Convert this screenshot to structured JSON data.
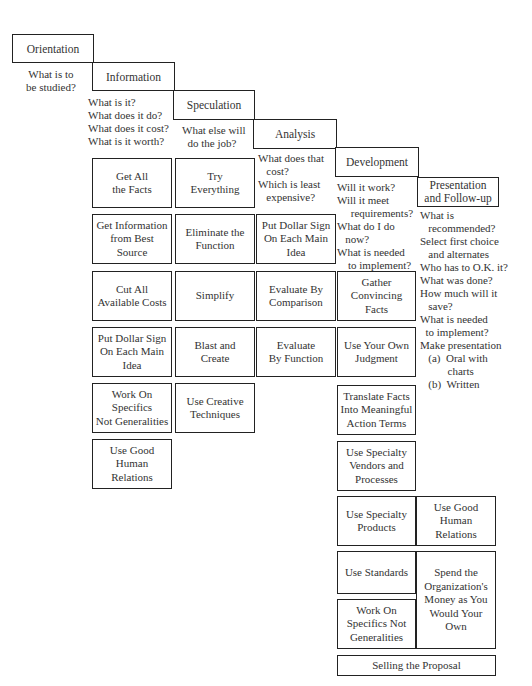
{
  "stages": [
    {
      "id": "orientation",
      "label": "Orientation"
    },
    {
      "id": "information",
      "label": "Information"
    },
    {
      "id": "speculation",
      "label": "Speculation"
    },
    {
      "id": "analysis",
      "label": "Analysis"
    },
    {
      "id": "development",
      "label": "Development"
    },
    {
      "id": "presentation",
      "label": "Presentation\nand Follow-up"
    }
  ],
  "questions": {
    "orientation": "What is to\nbe studied?",
    "information": "What is it?\nWhat does it do?\nWhat does it cost?\nWhat is it worth?",
    "speculation": "What else will\n  do the job?",
    "analysis": "What does that\n   cost?\nWhich is least\n   expensive?",
    "development": "Will it work?\nWill it meet\n     requirements?\nWhat do I do\n   now?\nWhat is needed\n    to implement?",
    "presentation": "What is\n   recommended?\nSelect first choice\n   and alternates\nWho has to O.K. it?\nWhat was done?\nHow much will it\n   save?\nWhat is needed\n  to implement?\nMake presentation\n   (a)  Oral with\n          charts\n   (b)  Written"
  },
  "techniques": {
    "information": [
      "Get All\nthe Facts",
      "Get Information\nfrom Best Source",
      "Cut All\nAvailable Costs",
      "Put Dollar Sign\nOn Each Main\nIdea",
      "Work On\nSpecifics\nNot Generalities",
      "Use Good\nHuman\nRelations"
    ],
    "speculation": [
      "Try\nEverything",
      "Eliminate the\nFunction",
      "Simplify",
      "Blast and\nCreate",
      "Use Creative\nTechniques"
    ],
    "analysis": [
      "Put Dollar Sign\nOn Each Main\nIdea",
      "Evaluate By\nComparison",
      "Evaluate\nBy Function"
    ],
    "development": [
      "Gather\nConvincing\nFacts",
      "Use Your Own\nJudgment",
      "Translate Facts\nInto Meaningful\nAction Terms",
      "Use Specialty\nVendors and\nProcesses",
      "Use Specialty\nProducts",
      "Use Standards",
      "Work On\nSpecifics Not\nGeneralities"
    ],
    "presentation": [
      "Use Good\nHuman\nRelations",
      "Spend the\nOrganization's\nMoney as You\nWould Your\nOwn"
    ],
    "footer": "Selling the Proposal"
  }
}
